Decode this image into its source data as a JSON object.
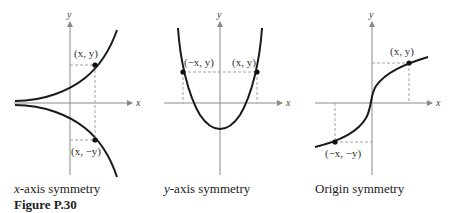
{
  "figure": {
    "label": "Figure P.30",
    "panels": [
      {
        "id": "x-axis",
        "caption_var": "x",
        "caption_rest": "-axis symmetry",
        "axis_x_label": "x",
        "axis_y_label": "y",
        "point_labels": [
          "(x, y)",
          "(x, −y)"
        ]
      },
      {
        "id": "y-axis",
        "caption_var": "y",
        "caption_rest": "-axis symmetry",
        "axis_x_label": "x",
        "axis_y_label": "y",
        "point_labels": [
          "(−x, y)",
          "(x, y)"
        ]
      },
      {
        "id": "origin",
        "caption_var": "",
        "caption_rest": "Origin symmetry",
        "axis_x_label": "x",
        "axis_y_label": "y",
        "point_labels": [
          "(x, y)",
          "(−x, −y)"
        ]
      }
    ]
  },
  "colors": {
    "curve": "#1a1a1a",
    "axis": "#8a8a8a",
    "dash": "#8a8a8a",
    "text": "#222222"
  }
}
